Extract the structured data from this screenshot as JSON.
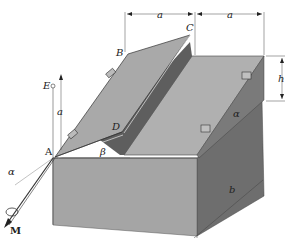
{
  "diagram": {
    "points": {
      "A": "A",
      "B": "B",
      "C": "C",
      "D": "D",
      "E": "E"
    },
    "dimensions": {
      "width_left": "a",
      "width_right": "a",
      "height": "h",
      "depth": "b",
      "vertical_a": "a"
    },
    "angles": {
      "alpha_left": "α",
      "alpha_right": "α",
      "beta": "β"
    },
    "moment": "M",
    "colors": {
      "lid_top": "#a8a8a8",
      "box_front": "#9a9a9a",
      "box_side": "#6e6e6e",
      "inner_dark": "#5a5a5a",
      "line": "#333333"
    }
  }
}
